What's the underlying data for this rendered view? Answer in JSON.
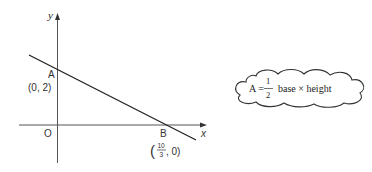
{
  "graph": {
    "axis_labels": {
      "x": "x",
      "y": "y"
    },
    "origin_label": "O",
    "point_a": {
      "label": "A",
      "coords": "(0, 2)"
    },
    "point_b": {
      "label": "B",
      "coords_numerator": "10",
      "coords_denominator": "3",
      "coords_suffix": ", 0)",
      "coords_prefix": "("
    },
    "colors": {
      "axis": "#444444",
      "line": "#222222",
      "text": "#333333"
    }
  },
  "formula_cloud": {
    "lhs": "A =",
    "fraction_numerator": "1",
    "fraction_denominator": "2",
    "rhs": "base × height"
  }
}
